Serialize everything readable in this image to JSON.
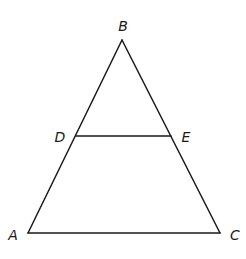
{
  "diagram": {
    "type": "triangle-with-midsegment",
    "stroke_color": "#1a1a1a",
    "points": {
      "A": {
        "label": "A",
        "x": 28,
        "y": 233,
        "lx": 13,
        "ly": 240
      },
      "B": {
        "label": "B",
        "x": 122,
        "y": 40,
        "lx": 123,
        "ly": 31
      },
      "C": {
        "label": "C",
        "x": 220,
        "y": 233,
        "lx": 235,
        "ly": 240
      },
      "D": {
        "label": "D",
        "x": 76,
        "y": 136,
        "lx": 60,
        "ly": 142
      },
      "E": {
        "label": "E",
        "x": 171,
        "y": 136,
        "lx": 186,
        "ly": 142
      }
    },
    "segments": [
      {
        "name": "AB",
        "from": "A",
        "to": "B"
      },
      {
        "name": "BC",
        "from": "B",
        "to": "C"
      },
      {
        "name": "AC",
        "from": "A",
        "to": "C"
      },
      {
        "name": "DE",
        "from": "D",
        "to": "E"
      }
    ]
  }
}
